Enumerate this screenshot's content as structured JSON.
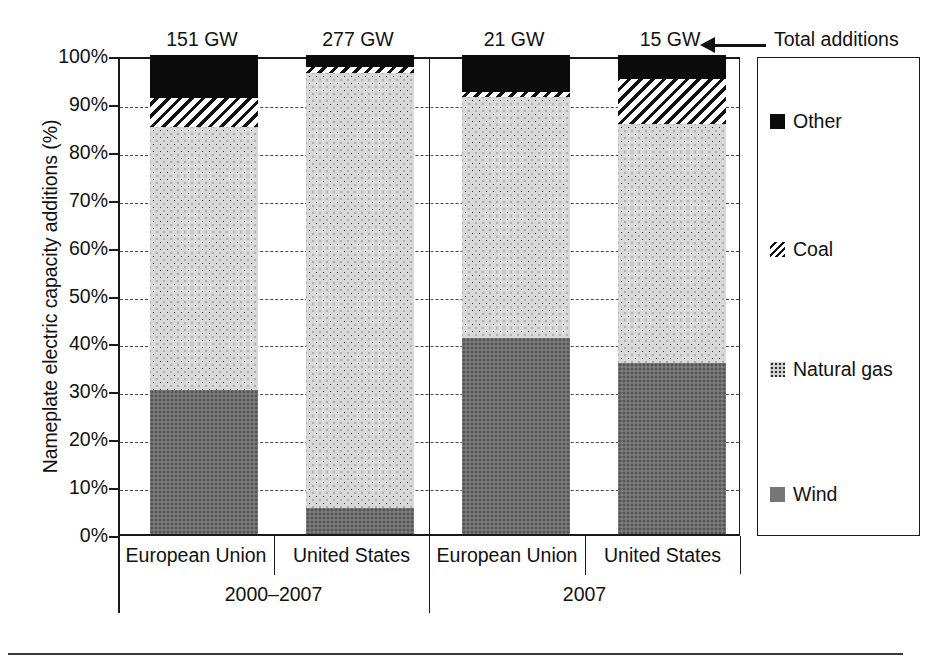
{
  "chart_data": {
    "type": "bar",
    "title": "",
    "subtitle": "",
    "xlabel": "",
    "ylabel": "Nameplate electric capacity additions (%)",
    "ylim": [
      0,
      100
    ],
    "y_tick_labels": [
      "100%",
      "90%",
      "80%",
      "70%",
      "60%",
      "50%",
      "40%",
      "30%",
      "20%",
      "10%",
      "0%"
    ],
    "y_tick_values": [
      100,
      90,
      80,
      70,
      60,
      50,
      40,
      30,
      20,
      10,
      0
    ],
    "grid": "horizontal-dashed",
    "stacked": true,
    "stack_order_bottom_to_top": [
      "Wind",
      "Natural gas",
      "Coal",
      "Other"
    ],
    "legend_position": "right",
    "categories": [
      "European Union",
      "United States",
      "European Union",
      "United States"
    ],
    "groups": [
      {
        "label": "2000–2007",
        "categories": [
          "European Union",
          "United States"
        ]
      },
      {
        "label": "2007",
        "categories": [
          "European Union",
          "United States"
        ]
      }
    ],
    "annotation_labels": [
      "151 GW",
      "277 GW",
      "21 GW",
      "15 GW"
    ],
    "annotation_caption": "Total additions",
    "series": [
      {
        "name": "Wind",
        "values": [
          30.0,
          5.5,
          41.0,
          35.8
        ]
      },
      {
        "name": "Natural gas",
        "values": [
          55.0,
          90.8,
          50.5,
          49.7
        ]
      },
      {
        "name": "Coal",
        "values": [
          5.5,
          1.2,
          1.0,
          9.5
        ]
      },
      {
        "name": "Other",
        "values": [
          9.5,
          2.5,
          7.5,
          5.0
        ]
      }
    ],
    "bars": [
      {
        "group": "2000–2007",
        "region": "European Union",
        "total_additions": "151 GW",
        "segments": [
          {
            "name": "Wind",
            "from": 0.0,
            "to": 30.0,
            "value": 30.0
          },
          {
            "name": "Natural gas",
            "from": 30.0,
            "to": 85.0,
            "value": 55.0
          },
          {
            "name": "Coal",
            "from": 85.0,
            "to": 91.0,
            "value": 6.0
          },
          {
            "name": "Other",
            "from": 91.0,
            "to": 100.0,
            "value": 9.0
          }
        ]
      },
      {
        "group": "2000–2007",
        "region": "United States",
        "total_additions": "277 GW",
        "segments": [
          {
            "name": "Wind",
            "from": 0.0,
            "to": 5.5,
            "value": 5.5
          },
          {
            "name": "Natural gas",
            "from": 5.5,
            "to": 96.3,
            "value": 90.8
          },
          {
            "name": "Coal",
            "from": 96.3,
            "to": 97.5,
            "value": 1.2
          },
          {
            "name": "Other",
            "from": 97.5,
            "to": 100.0,
            "value": 2.5
          }
        ]
      },
      {
        "group": "2007",
        "region": "European Union",
        "total_additions": "21 GW",
        "segments": [
          {
            "name": "Wind",
            "from": 0.0,
            "to": 41.0,
            "value": 41.0
          },
          {
            "name": "Natural gas",
            "from": 41.0,
            "to": 91.3,
            "value": 50.3
          },
          {
            "name": "Coal",
            "from": 91.3,
            "to": 92.3,
            "value": 1.0
          },
          {
            "name": "Other",
            "from": 92.3,
            "to": 100.0,
            "value": 7.7
          }
        ]
      },
      {
        "group": "2007",
        "region": "United States",
        "total_additions": "15 GW",
        "segments": [
          {
            "name": "Wind",
            "from": 0.0,
            "to": 35.8,
            "value": 35.8
          },
          {
            "name": "Natural gas",
            "from": 35.8,
            "to": 85.5,
            "value": 49.7
          },
          {
            "name": "Coal",
            "from": 85.5,
            "to": 95.0,
            "value": 9.5
          },
          {
            "name": "Other",
            "from": 95.0,
            "to": 100.0,
            "value": 5.0
          }
        ]
      }
    ],
    "legend": [
      {
        "label": "Other",
        "pattern": "solid-black",
        "color": "#0b0b0b"
      },
      {
        "label": "Coal",
        "pattern": "diagonal-hatch",
        "color": "#111111"
      },
      {
        "label": "Natural gas",
        "pattern": "light-dotted",
        "color": "#d8d8d8"
      },
      {
        "label": "Wind",
        "pattern": "solid-gray",
        "color": "#6e6e6e"
      }
    ]
  },
  "axis": {
    "y_title": "Nameplate electric capacity additions (%)",
    "ticks": [
      "100%",
      "90%",
      "80%",
      "70%",
      "60%",
      "50%",
      "40%",
      "30%",
      "20%",
      "10%",
      "0%"
    ]
  },
  "annotation": {
    "caption": "Total additions",
    "totals": [
      "151 GW",
      "277 GW",
      "21 GW",
      "15 GW"
    ]
  },
  "xaxis": {
    "categories": [
      "European Union",
      "United States",
      "European Union",
      "United States"
    ],
    "groups": [
      "2000–2007",
      "2007"
    ]
  },
  "legend": {
    "items": [
      {
        "label": "Other"
      },
      {
        "label": "Coal"
      },
      {
        "label": "Natural gas"
      },
      {
        "label": "Wind"
      }
    ]
  }
}
